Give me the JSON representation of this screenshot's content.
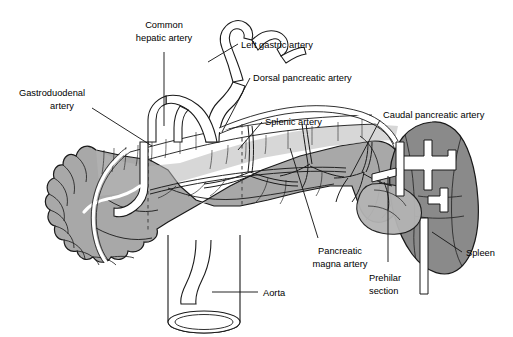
{
  "figure": {
    "background_color": "#ffffff",
    "line_color": "#1a1a1a",
    "pancreas_fill": "#a8a8a8",
    "pancreas_fill_light": "#bdbdbd",
    "spleen_fill": "#8a8a8a",
    "vessel_fill": "#ffffff"
  },
  "labels": {
    "common_hepatic_artery": {
      "line1": "Common",
      "line2": "hepatic artery"
    },
    "gastroduodenal_artery": {
      "line1": "Gastroduodenal",
      "line2": "artery"
    },
    "left_gastric_artery": {
      "line1": "Left gastric artery"
    },
    "dorsal_pancreatic_artery": {
      "line1": "Dorsal pancreatic artery"
    },
    "splenic_artery": {
      "line1": "Splenic artery"
    },
    "caudal_pancreatic_artery": {
      "line1": "Caudal pancreatic artery"
    },
    "pancreatic_magna_artery": {
      "line1": "Pancreatic",
      "line2": "magna artery"
    },
    "prehilar_section": {
      "line1": "Prehilar",
      "line2": "section"
    },
    "spleen": {
      "line1": "Spleen"
    },
    "aorta": {
      "line1": "Aorta"
    }
  },
  "structures": [
    {
      "name": "pancreas",
      "type": "organ"
    },
    {
      "name": "spleen",
      "type": "organ"
    },
    {
      "name": "aorta",
      "type": "vessel"
    },
    {
      "name": "celiac-trunk",
      "type": "vessel"
    },
    {
      "name": "splenic-artery",
      "type": "vessel"
    },
    {
      "name": "common-hepatic-artery",
      "type": "vessel"
    },
    {
      "name": "left-gastric-artery",
      "type": "vessel"
    },
    {
      "name": "gastroduodenal-artery",
      "type": "vessel"
    },
    {
      "name": "dorsal-pancreatic-artery",
      "type": "vessel"
    },
    {
      "name": "pancreatic-magna-artery",
      "type": "vessel"
    },
    {
      "name": "caudal-pancreatic-artery",
      "type": "vessel"
    }
  ]
}
